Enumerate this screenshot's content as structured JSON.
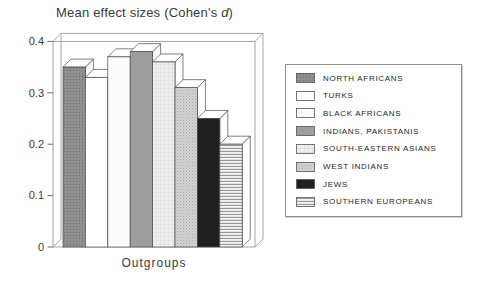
{
  "title": {
    "prefix": "Mean effect sizes (Cohen's ",
    "d": "d",
    "suffix": ")"
  },
  "axis": {
    "x_label": "Outgroups",
    "y_tick_labels": [
      "0",
      "0.1",
      "0.2",
      "0.3",
      "0.4"
    ]
  },
  "chart_data": {
    "type": "bar",
    "style": "3d-bars-grayscale",
    "title": "Mean effect sizes (Cohen's d)",
    "xlabel": "Outgroups",
    "ylabel": "",
    "ylim": [
      0,
      0.4
    ],
    "y_ticks": [
      0,
      0.1,
      0.2,
      0.3,
      0.4
    ],
    "grid": false,
    "legend_position": "right",
    "categories": [
      "NORTH AFRICANS",
      "TURKS",
      "BLACK AFRICANS",
      "INDIANS, PAKISTANIS",
      "SOUTH-EASTERN ASIANS",
      "WEST INDIANS",
      "JEWS",
      "SOUTHERN EUROPEANS"
    ],
    "values": [
      0.35,
      0.33,
      0.37,
      0.38,
      0.36,
      0.31,
      0.25,
      0.2
    ]
  },
  "legend": {
    "items": [
      {
        "label": "NORTH AFRICANS",
        "swatch": "dot-dark"
      },
      {
        "label": "TURKS",
        "swatch": "white"
      },
      {
        "label": "BLACK AFRICANS",
        "swatch": "near-white"
      },
      {
        "label": "INDIANS, PAKISTANIS",
        "swatch": "gray"
      },
      {
        "label": "SOUTH-EASTERN ASIANS",
        "swatch": "pale-grid"
      },
      {
        "label": "WEST INDIANS",
        "swatch": "dot-light"
      },
      {
        "label": "JEWS",
        "swatch": "black"
      },
      {
        "label": "SOUTHERN EUROPEANS",
        "swatch": "h-stripes"
      }
    ]
  },
  "colors": {
    "background": "#ffffff",
    "frame_line": "#9a9a9a",
    "bar_outline": "#4a4a4a",
    "text": "#3a3a3a",
    "fills": {
      "dot-dark": "#8f8f8f",
      "white": "#ffffff",
      "near-white": "#fbfbfb",
      "gray": "#9e9e9e",
      "pale-grid": "#efefef",
      "dot-light": "#c9c9c9",
      "black": "#202020",
      "h-stripes": "#e8e8e8"
    }
  }
}
